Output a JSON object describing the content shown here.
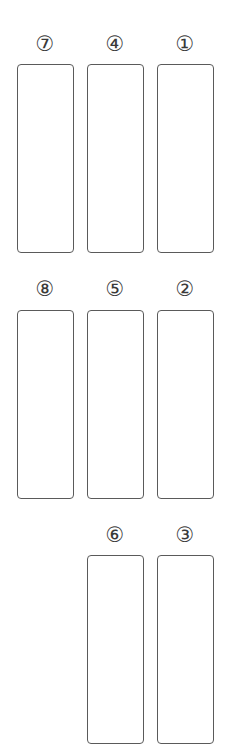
{
  "diagram": {
    "stroke_color": "#5a5a5a",
    "slots": [
      {
        "number": 1,
        "label": "①",
        "x": 157,
        "y": 64,
        "w": 57,
        "h": 189
      },
      {
        "number": 2,
        "label": "②",
        "x": 157,
        "y": 310,
        "w": 57,
        "h": 189
      },
      {
        "number": 3,
        "label": "③",
        "x": 157,
        "y": 555,
        "w": 57,
        "h": 189
      },
      {
        "number": 4,
        "label": "④",
        "x": 87,
        "y": 64,
        "w": 57,
        "h": 189
      },
      {
        "number": 5,
        "label": "⑤",
        "x": 87,
        "y": 310,
        "w": 57,
        "h": 189
      },
      {
        "number": 6,
        "label": "⑥",
        "x": 87,
        "y": 555,
        "w": 57,
        "h": 189
      },
      {
        "number": 7,
        "label": "⑦",
        "x": 17,
        "y": 64,
        "w": 57,
        "h": 189
      },
      {
        "number": 8,
        "label": "⑧",
        "x": 17,
        "y": 310,
        "w": 57,
        "h": 189
      }
    ]
  }
}
